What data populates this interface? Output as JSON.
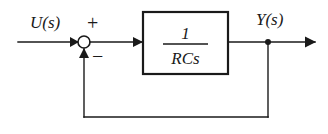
{
  "diagram": {
    "input_label": "U(s)",
    "output_label": "Y(s)",
    "sum_positive_sign": "+",
    "sum_negative_sign": "−",
    "transfer_function": {
      "numerator": "1",
      "denominator": "RCs"
    },
    "colors": {
      "line": "#1a1a1a",
      "background": "#ffffff",
      "block_fill": "#ffffff"
    }
  }
}
